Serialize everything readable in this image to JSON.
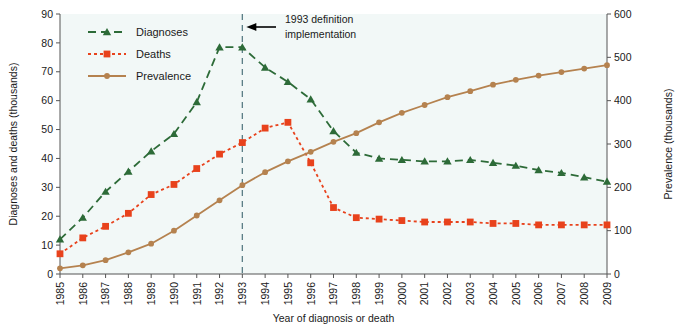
{
  "chart_data": {
    "type": "line",
    "title": "",
    "xlabel": "Year of diagnosis or death",
    "ylabel": "Diagnoses and deaths (thousands)",
    "y2label": "Prevalence (thousands)",
    "ylim": [
      0,
      90
    ],
    "y2lim": [
      0,
      600
    ],
    "grid": false,
    "legend_position": "top-left",
    "categories": [
      "1985",
      "1986",
      "1987",
      "1988",
      "1989",
      "1990",
      "1991",
      "1992",
      "1993",
      "1994",
      "1995",
      "1996",
      "1997",
      "1998",
      "1999",
      "2000",
      "2001",
      "2002",
      "2003",
      "2004",
      "2005",
      "2006",
      "2007",
      "2008",
      "2009"
    ],
    "yticks": [
      0,
      10,
      20,
      30,
      40,
      50,
      60,
      70,
      80,
      90
    ],
    "y2ticks": [
      0,
      100,
      200,
      300,
      400,
      500,
      600
    ],
    "series": [
      {
        "name": "Diagnoses",
        "axis": "left",
        "color": "#2d6b38",
        "marker": "triangle",
        "linestyle": "dashed",
        "values": [
          12,
          19.5,
          28.5,
          35.5,
          42.5,
          48.5,
          59.5,
          78.5,
          78.5,
          71.5,
          66.5,
          60.5,
          49.5,
          42,
          40,
          39.5,
          39,
          39,
          39.5,
          38.5,
          37.5,
          36,
          35,
          33.5,
          32
        ]
      },
      {
        "name": "Deaths",
        "axis": "left",
        "color": "#e8421c",
        "marker": "square",
        "linestyle": "dotted",
        "values": [
          7,
          12.5,
          16.5,
          21,
          27.5,
          31,
          36.5,
          41.5,
          45.5,
          50.5,
          52.5,
          38.5,
          23,
          19.5,
          19,
          18.5,
          18,
          18,
          18,
          17.5,
          17.5,
          17,
          17,
          17,
          17
        ]
      },
      {
        "name": "Prevalence",
        "axis": "right",
        "color": "#b5824f",
        "marker": "circle",
        "linestyle": "solid",
        "values": [
          13,
          20,
          32,
          50,
          70,
          100,
          135,
          170,
          205,
          235,
          260,
          282,
          305,
          325,
          350,
          372,
          390,
          408,
          422,
          437,
          448,
          458,
          466,
          474,
          482
        ]
      }
    ],
    "annotations": [
      {
        "text_line1": "1993 definition",
        "text_line2": "implementation",
        "at_category": "1993",
        "style": "vertical-dashed-line-with-arrow"
      }
    ]
  },
  "colors": {
    "diagnoses": "#2d6b38",
    "deaths": "#e8421c",
    "prevalence": "#b5824f",
    "annotation_line": "#5a7d86",
    "plot_background": "#f2f8f7",
    "axis": "#555555",
    "text": "#1a1a1a"
  }
}
